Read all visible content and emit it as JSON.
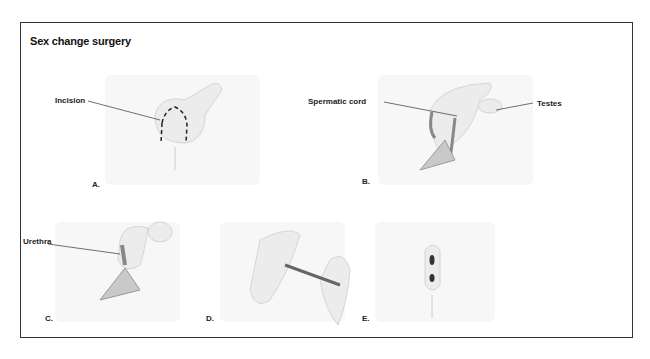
{
  "title": "Sex change surgery",
  "panels": [
    {
      "letter": "A.",
      "callouts": [
        "Incision"
      ]
    },
    {
      "letter": "B.",
      "callouts": [
        "Spermatic cord",
        "Testes"
      ]
    },
    {
      "letter": "C.",
      "callouts": [
        "Urethra"
      ]
    },
    {
      "letter": "D.",
      "callouts": []
    },
    {
      "letter": "E.",
      "callouts": []
    }
  ]
}
